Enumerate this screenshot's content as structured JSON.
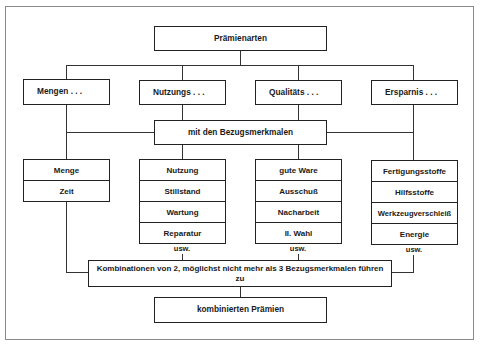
{
  "title": "Prämienarten",
  "categories": [
    {
      "label": "Mengen . . ."
    },
    {
      "label": "Nutzungs . . ."
    },
    {
      "label": "Qualitäts . . ."
    },
    {
      "label": "Ersparnis . . ."
    }
  ],
  "connector_label": "mit den Bezugsmerkmalen",
  "lists": [
    {
      "items": [
        "Menge",
        "Zeit"
      ],
      "more": ""
    },
    {
      "items": [
        "Nutzung",
        "Stillstand",
        "Wartung",
        "Reparatur"
      ],
      "more": "usw."
    },
    {
      "items": [
        "gute Ware",
        "Ausschuß",
        "Nacharbeit",
        "II. Wahl"
      ],
      "more": "usw."
    },
    {
      "items": [
        "Fertigungsstoffe",
        "Hilfsstoffe",
        "Werkzeugverschleiß",
        "Energie"
      ],
      "more": "usw."
    }
  ],
  "combination_label": "Kombinationen von 2, möglichst nicht mehr als 3 Bezugsmerkmalen führen zu",
  "result_label": "kombinierten Prämien"
}
